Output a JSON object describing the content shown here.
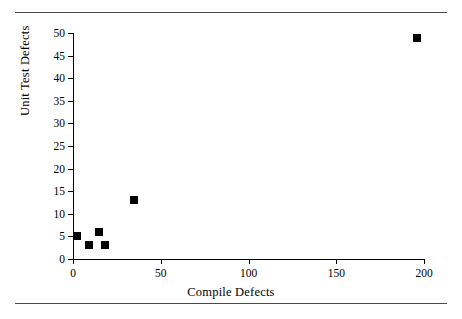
{
  "chart_data": {
    "type": "scatter",
    "title": "",
    "xlabel": "Compile Defects",
    "ylabel": "Unit Test Defects",
    "xlim": [
      0,
      200
    ],
    "ylim": [
      0,
      50
    ],
    "xticks": [
      0,
      50,
      100,
      150,
      200
    ],
    "yticks": [
      0,
      5,
      10,
      15,
      20,
      25,
      30,
      35,
      40,
      45,
      50
    ],
    "grid": false,
    "legend": null,
    "marker_style": "filled-square",
    "marker_color": "#000000",
    "series": [
      {
        "name": "defects",
        "points": [
          {
            "x": 2,
            "y": 5
          },
          {
            "x": 9,
            "y": 3
          },
          {
            "x": 15,
            "y": 6
          },
          {
            "x": 18,
            "y": 3
          },
          {
            "x": 35,
            "y": 13
          },
          {
            "x": 196,
            "y": 49
          }
        ]
      }
    ]
  },
  "figure": {
    "x_axis_title": "Compile Defects",
    "y_axis_title": "Unit Test Defects",
    "x_tick_labels": [
      "0",
      "50",
      "100",
      "150",
      "200"
    ],
    "y_tick_labels": [
      "0",
      "5",
      "10",
      "15",
      "20",
      "25",
      "30",
      "35",
      "40",
      "45",
      "50"
    ]
  },
  "rules": {
    "top_rule": "",
    "bottom_rule": ""
  }
}
